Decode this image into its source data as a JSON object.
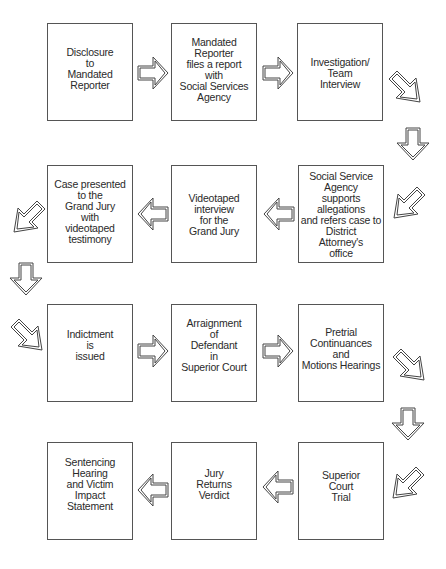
{
  "diagram": {
    "type": "flowchart",
    "rows": [
      {
        "direction": "left-to-right",
        "steps": [
          {
            "id": 1,
            "label": "Disclosure\nto\nMandated\nReporter"
          },
          {
            "id": 2,
            "label": "Mandated\nReporter\nfiles a report\nwith\nSocial Services\nAgency"
          },
          {
            "id": 3,
            "label": "Investigation/\nTeam\nInterview"
          }
        ]
      },
      {
        "direction": "right-to-left",
        "steps": [
          {
            "id": 4,
            "label": "Social Service\nAgency\nsupports\nallegations\nand refers case to\nDistrict\nAttorney's\noffice"
          },
          {
            "id": 5,
            "label": "Videotaped\ninterview\nfor the\nGrand Jury"
          },
          {
            "id": 6,
            "label": "Case presented\nto the\nGrand Jury\nwith\nvideotaped\ntestimony"
          }
        ]
      },
      {
        "direction": "left-to-right",
        "steps": [
          {
            "id": 7,
            "label": "Indictment\nis\nissued"
          },
          {
            "id": 8,
            "label": "Arraignment\nof\nDefendant\nin\nSuperior Court"
          },
          {
            "id": 9,
            "label": "Pretrial\nContinuances\nand\nMotions Hearings"
          }
        ]
      },
      {
        "direction": "right-to-left",
        "steps": [
          {
            "id": 10,
            "label": "Superior\nCourt\nTrial"
          },
          {
            "id": 11,
            "label": "Jury\nReturns\nVerdict"
          },
          {
            "id": 12,
            "label": "Sentencing\nHearing\nand Victim\nImpact\nStatement"
          }
        ]
      }
    ],
    "colors": {
      "stroke": "#555555",
      "background": "#ffffff",
      "text": "#2a2a2a"
    }
  }
}
